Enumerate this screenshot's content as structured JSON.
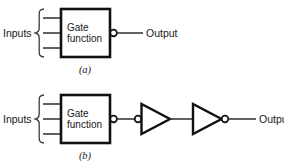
{
  "figure": {
    "panels": [
      {
        "id": "a",
        "caption": "(a)",
        "inputs_label": "Inputs",
        "input_count": 3,
        "gate_label_line1": "Gate",
        "gate_label_line2": "function",
        "output_label": "Output",
        "output_inverted": true,
        "stages": []
      },
      {
        "id": "b",
        "caption": "(b)",
        "inputs_label": "Inputs",
        "input_count": 3,
        "gate_label_line1": "Gate",
        "gate_label_line2": "function",
        "output_label": "Output",
        "output_inverted": true,
        "stages": [
          {
            "name": "inverter-1",
            "bubble": "input"
          },
          {
            "name": "inverter-2",
            "bubble": "output"
          }
        ]
      }
    ]
  },
  "colors": {
    "background": "#ffffff",
    "box_stroke": "#111111",
    "wire_stroke": "#3a3a3a",
    "text": "#1a1a1a"
  }
}
